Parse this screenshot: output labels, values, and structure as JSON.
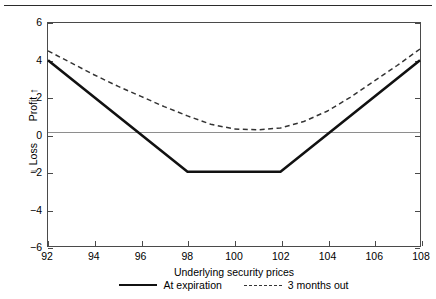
{
  "chart_data": {
    "type": "line",
    "title": "",
    "xlabel": "Underlying security prices",
    "ylabel_profit": "Profit",
    "ylabel_loss": "Loss",
    "xlim": [
      92,
      108
    ],
    "ylim": [
      -6,
      6
    ],
    "xticks": [
      92,
      94,
      96,
      98,
      100,
      102,
      104,
      106,
      108
    ],
    "yticks": [
      6,
      4,
      2,
      0,
      -2,
      -4,
      -6
    ],
    "grid": false,
    "legend_position": "bottom-center",
    "zero_line": 0,
    "series": [
      {
        "name": "At expiration",
        "style": "solid",
        "color": "#111111",
        "x": [
          92,
          98,
          102,
          108
        ],
        "values": [
          4,
          -2,
          -2,
          4
        ]
      },
      {
        "name": "3 months out",
        "style": "dashed",
        "color": "#333333",
        "x": [
          92,
          93,
          94,
          95,
          96,
          97,
          98,
          99,
          100,
          101,
          102,
          103,
          104,
          105,
          106,
          107,
          108
        ],
        "values": [
          4.5,
          3.85,
          3.2,
          2.6,
          2.05,
          1.5,
          1.0,
          0.55,
          0.3,
          0.25,
          0.35,
          0.7,
          1.25,
          2.0,
          2.85,
          3.7,
          4.6
        ]
      }
    ]
  },
  "axes": {
    "x_tick_labels": [
      "92",
      "94",
      "96",
      "98",
      "100",
      "102",
      "104",
      "106",
      "108"
    ],
    "y_tick_labels": [
      "6",
      "4",
      "2",
      "0",
      "−2",
      "−4",
      "−6"
    ],
    "x_title": "Underlying security prices",
    "y_title_profit": "Profit",
    "y_title_loss": "Loss",
    "profit_arrow": "↑",
    "loss_arrow": "↓"
  },
  "legend": {
    "entries": [
      {
        "label": "At expiration",
        "style": "solid"
      },
      {
        "label": "3 months out",
        "style": "dashed"
      }
    ]
  }
}
